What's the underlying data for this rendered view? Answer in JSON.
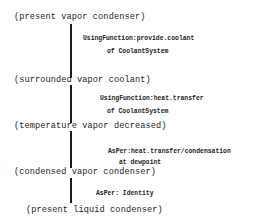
{
  "diagram": {
    "states": [
      {
        "text": "(present vapor condenser)"
      },
      {
        "text": "(surrounded vapor coolant)"
      },
      {
        "text": "(temperature vapor decreased)"
      },
      {
        "text": "(condensed vapor condenser)"
      },
      {
        "text": "(present liquid condenser)"
      }
    ],
    "transitions": [
      {
        "line1": "UsingFunction:provide.coolant",
        "line2": "of CoolantSystem"
      },
      {
        "line1": "UsingFunction:heat.transfer",
        "line2": "of CoolantSystem"
      },
      {
        "line1": "AsPer:heat.transfer/condensation",
        "line2": "at dewpoint"
      },
      {
        "line1": "AsPer: Identity"
      }
    ]
  }
}
